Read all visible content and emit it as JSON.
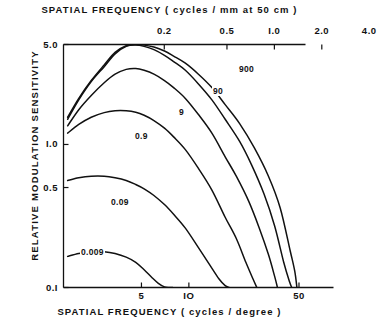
{
  "titles": {
    "top_axis": "SPATIAL  FREQUENCY  ( cycles / mm  at  50 cm )",
    "bottom_axis": "SPATIAL  FREQUENCY  ( cycles / degree )",
    "y_axis": "RELATIVE  MODULATION  SENSITIVITY"
  },
  "chart_data": {
    "type": "line",
    "title": "",
    "xlabel": "SPATIAL  FREQUENCY  ( cycles / degree )",
    "ylabel": "RELATIVE  MODULATION  SENSITIVITY",
    "xlabel_top": "SPATIAL  FREQUENCY  ( cycles / mm  at  50 cm )",
    "xscale": "log",
    "yscale": "log",
    "xlim": [
      1.6,
      55
    ],
    "ylim": [
      0.1,
      5.0
    ],
    "xticks": [
      5,
      10,
      50
    ],
    "xtick_labels": [
      "5",
      "IO",
      "50"
    ],
    "xticks_top": [
      0.2,
      0.5,
      1.0,
      2.0,
      4.0
    ],
    "xtick_labels_top": [
      "0.2",
      "0.5",
      "I.0",
      "2.0",
      "4.0"
    ],
    "yticks": [
      5.0,
      1.0,
      0.5,
      0.1
    ],
    "ytick_labels": [
      "5.0",
      "I.0",
      "0.5",
      "0.I"
    ],
    "grid": false,
    "legend": "inline-curve-labels",
    "series": [
      {
        "name": "900",
        "label": "900",
        "label_pos": {
          "x": 238,
          "y": 64
        },
        "x": [
          1.7,
          2.0,
          2.4,
          2.9,
          3.4,
          4.0,
          4.6,
          5.2,
          6.0,
          7.0,
          8.0,
          9.5,
          11.5,
          14,
          17,
          21,
          26,
          32,
          38,
          44,
          47,
          48.5
        ],
        "y": [
          1.55,
          2.1,
          2.8,
          3.6,
          4.4,
          4.9,
          5.0,
          4.95,
          4.8,
          4.5,
          4.15,
          3.7,
          3.1,
          2.5,
          1.9,
          1.4,
          0.95,
          0.6,
          0.36,
          0.18,
          0.13,
          0.1
        ]
      },
      {
        "name": "90",
        "label": "90",
        "label_pos": {
          "x": 212,
          "y": 86
        },
        "x": [
          1.7,
          2.0,
          2.4,
          2.9,
          3.4,
          4.0,
          4.6,
          5.2,
          6.0,
          7.0,
          8.0,
          9.5,
          11.5,
          14,
          17,
          21,
          25,
          30,
          35,
          40,
          43.5,
          45
        ],
        "y": [
          1.5,
          2.05,
          2.75,
          3.5,
          4.3,
          4.85,
          4.95,
          4.85,
          4.6,
          4.2,
          3.8,
          3.3,
          2.65,
          2.05,
          1.5,
          1.05,
          0.72,
          0.45,
          0.27,
          0.15,
          0.11,
          0.1
        ]
      },
      {
        "name": "9",
        "label": "9",
        "label_pos": {
          "x": 178,
          "y": 107
        },
        "x": [
          1.7,
          2.0,
          2.4,
          2.9,
          3.4,
          4.0,
          4.6,
          5.2,
          6.0,
          7.0,
          8.0,
          9.5,
          11.5,
          14,
          17,
          20,
          24,
          28,
          32,
          35,
          36.5
        ],
        "y": [
          1.35,
          1.75,
          2.2,
          2.7,
          3.1,
          3.35,
          3.4,
          3.3,
          3.1,
          2.8,
          2.5,
          2.1,
          1.62,
          1.2,
          0.82,
          0.6,
          0.4,
          0.26,
          0.17,
          0.12,
          0.1
        ]
      },
      {
        "name": "0.9",
        "label": "0.9",
        "label_pos": {
          "x": 134,
          "y": 131
        },
        "x": [
          1.7,
          2.0,
          2.4,
          2.9,
          3.4,
          4.0,
          4.6,
          5.2,
          6.0,
          7.0,
          8.0,
          9.5,
          11.5,
          14,
          17,
          20,
          23,
          25.5,
          27
        ],
        "y": [
          1.2,
          1.38,
          1.55,
          1.67,
          1.72,
          1.72,
          1.68,
          1.6,
          1.47,
          1.3,
          1.13,
          0.92,
          0.68,
          0.48,
          0.31,
          0.22,
          0.15,
          0.115,
          0.1
        ]
      },
      {
        "name": "0.09",
        "label": "0.09",
        "label_pos": {
          "x": 110,
          "y": 197
        },
        "x": [
          1.7,
          2.0,
          2.4,
          2.9,
          3.4,
          4.0,
          4.6,
          5.2,
          6.0,
          7.0,
          8.0,
          9.5,
          11.5,
          13.5,
          15.5,
          17,
          18
        ],
        "y": [
          0.56,
          0.585,
          0.6,
          0.6,
          0.585,
          0.56,
          0.525,
          0.49,
          0.44,
          0.38,
          0.325,
          0.26,
          0.19,
          0.145,
          0.115,
          0.103,
          0.1
        ]
      },
      {
        "name": "0.009",
        "label": "0.009",
        "label_pos": {
          "x": 80,
          "y": 247
        },
        "x": [
          1.7,
          2.0,
          2.4,
          2.9,
          3.4,
          4.0,
          4.6,
          5.2,
          5.8,
          6.4,
          7.0,
          7.5,
          7.9
        ],
        "y": [
          0.165,
          0.173,
          0.178,
          0.178,
          0.173,
          0.163,
          0.15,
          0.133,
          0.118,
          0.107,
          0.101,
          0.1,
          0.1
        ]
      }
    ]
  }
}
